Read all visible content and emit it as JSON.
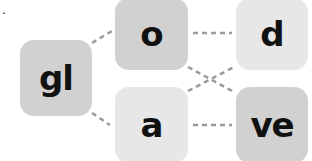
{
  "label_mark": ".",
  "diagram": {
    "tiles": [
      {
        "id": "gl",
        "text": "gl",
        "shade": "dark"
      },
      {
        "id": "o",
        "text": "o",
        "shade": "dark"
      },
      {
        "id": "a",
        "text": "a",
        "shade": "light"
      },
      {
        "id": "d",
        "text": "d",
        "shade": "light"
      },
      {
        "id": "ve",
        "text": "ve",
        "shade": "dark"
      }
    ],
    "connections": [
      [
        "gl",
        "o"
      ],
      [
        "gl",
        "a"
      ],
      [
        "o",
        "d"
      ],
      [
        "o",
        "ve"
      ],
      [
        "a",
        "d"
      ],
      [
        "a",
        "ve"
      ]
    ],
    "colors": {
      "dark": "#d1d1d1",
      "light": "#e7e7e7",
      "line": "#9a9a9a",
      "text": "#111111"
    }
  }
}
